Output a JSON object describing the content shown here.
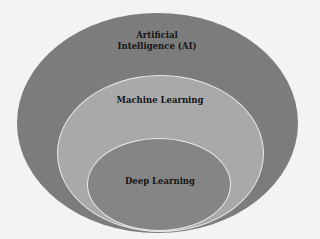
{
  "diagram": {
    "type": "nested-ellipses",
    "layers": [
      {
        "id": "ai",
        "label_line1": "Artificial",
        "label_line2": "Intelligence (AI)",
        "color": "#7c7c7c"
      },
      {
        "id": "ml",
        "label": "Machine Learning",
        "color": "#a9a9a9"
      },
      {
        "id": "dl",
        "label": "Deep Learning",
        "color": "#858585"
      }
    ],
    "outline_color": "#e9e9e9",
    "background": "#f3f3f1"
  }
}
